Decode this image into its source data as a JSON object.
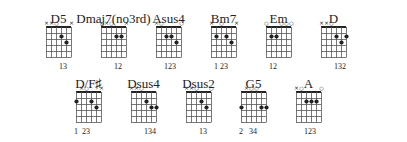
{
  "diagram": {
    "colors": {
      "ink": "#222222",
      "grid": "#444444",
      "background": "#ffffff"
    },
    "chords": [
      {
        "name": "D5",
        "row": 0,
        "x": 46,
        "markers": [
          "x",
          "x",
          "o",
          "",
          "",
          "x"
        ],
        "dots": [
          [
            4,
            2
          ],
          [
            5,
            3
          ]
        ],
        "fingers": "  13  ",
        "fingers_text": "13"
      },
      {
        "name": "Dmaj7(no3rd)",
        "row": 0,
        "x": 101,
        "markers": [
          "x",
          "x",
          "o",
          "",
          "",
          "x"
        ],
        "dots": [
          [
            4,
            2
          ],
          [
            5,
            2
          ]
        ],
        "fingers_text": "12"
      },
      {
        "name": "Asus4",
        "row": 0,
        "x": 156,
        "markers": [
          "x",
          "o",
          "",
          "",
          "",
          "o"
        ],
        "dots": [
          [
            3,
            2
          ],
          [
            4,
            2
          ],
          [
            5,
            3
          ]
        ],
        "fingers_text": "123"
      },
      {
        "name": "Bm7",
        "row": 0,
        "x": 211,
        "markers": [
          "x",
          "",
          "o",
          "",
          "",
          "x"
        ],
        "dots": [
          [
            2,
            2
          ],
          [
            4,
            2
          ],
          [
            5,
            3
          ]
        ],
        "fingers_text": "1 23"
      },
      {
        "name": "Em",
        "row": 0,
        "x": 266,
        "markers": [
          "o",
          "",
          "",
          "o",
          "o",
          "o"
        ],
        "dots": [
          [
            2,
            2
          ],
          [
            3,
            2
          ]
        ],
        "fingers_text": "12"
      },
      {
        "name": "D",
        "row": 0,
        "x": 321,
        "markers": [
          "x",
          "x",
          "o",
          "",
          "",
          ""
        ],
        "dots": [
          [
            4,
            2
          ],
          [
            5,
            3
          ],
          [
            6,
            2
          ]
        ],
        "fingers_text": "132"
      },
      {
        "name": "D/F♯",
        "row": 1,
        "x": 76,
        "markers": [
          "",
          "x",
          "o",
          "",
          "",
          "x"
        ],
        "dots": [
          [
            1,
            2
          ],
          [
            4,
            2
          ],
          [
            5,
            3
          ]
        ],
        "fingers_text": "1  23"
      },
      {
        "name": "Dsus4",
        "row": 1,
        "x": 131,
        "markers": [
          "x",
          "x",
          "o",
          "",
          "",
          ""
        ],
        "dots": [
          [
            4,
            2
          ],
          [
            5,
            3
          ],
          [
            6,
            3
          ]
        ],
        "fingers_text": "134"
      },
      {
        "name": "Dsus2",
        "row": 1,
        "x": 186,
        "markers": [
          "x",
          "x",
          "o",
          "",
          "",
          "o"
        ],
        "dots": [
          [
            4,
            2
          ],
          [
            5,
            3
          ]
        ],
        "fingers_text": "13"
      },
      {
        "name": "G5",
        "row": 1,
        "x": 241,
        "markers": [
          "",
          "x",
          "o",
          "o",
          "",
          ""
        ],
        "dots": [
          [
            1,
            3
          ],
          [
            5,
            3
          ],
          [
            6,
            3
          ]
        ],
        "fingers_text": "2   34"
      },
      {
        "name": "A",
        "row": 1,
        "x": 296,
        "markers": [
          "x",
          "o",
          "",
          "",
          "",
          "o"
        ],
        "dots": [
          [
            3,
            2
          ],
          [
            4,
            2
          ],
          [
            5,
            2
          ]
        ],
        "fingers_text": "123"
      }
    ]
  }
}
